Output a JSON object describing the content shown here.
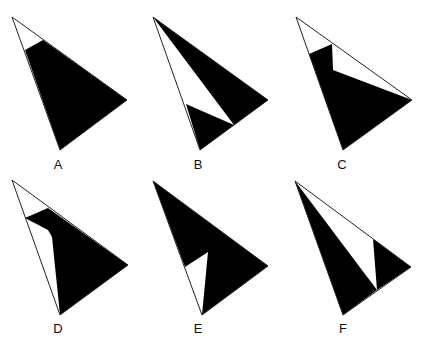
{
  "figure": {
    "colors": {
      "fill": "#000000",
      "outline": "#222222",
      "background": "#ffffff"
    },
    "panels": [
      {
        "label": "A",
        "label_pos": [
          58,
          158
        ],
        "outline": [
          [
            12,
            17
          ],
          [
            127,
            100
          ],
          [
            60,
            150
          ]
        ],
        "black": [
          [
            [
              25,
              50
            ],
            [
              43,
              40
            ],
            [
              127,
              100
            ],
            [
              60,
              150
            ]
          ]
        ]
      },
      {
        "label": "B",
        "label_pos": [
          198,
          158
        ],
        "outline": [
          [
            153,
            17
          ],
          [
            268,
            100
          ],
          [
            200,
            150
          ]
        ],
        "black": [
          [
            [
              153,
              17
            ],
            [
              268,
              100
            ],
            [
              234,
              125
            ]
          ],
          [
            [
              186,
              104
            ],
            [
              234,
              125
            ],
            [
              200,
              150
            ]
          ]
        ]
      },
      {
        "label": "C",
        "label_pos": [
          342,
          158
        ],
        "outline": [
          [
            296,
            17
          ],
          [
            412,
            100
          ],
          [
            343,
            150
          ]
        ],
        "black": [
          [
            [
              309,
              54
            ],
            [
              332,
              44
            ],
            [
              333,
              70
            ],
            [
              412,
              100
            ],
            [
              343,
              150
            ]
          ]
        ]
      },
      {
        "label": "D",
        "label_pos": [
          58,
          322
        ],
        "outline": [
          [
            12,
            180
          ],
          [
            128,
            265
          ],
          [
            60,
            315
          ]
        ],
        "black": [
          [
            [
              25,
              218
            ],
            [
              48,
              208
            ],
            [
              128,
              265
            ],
            [
              60,
              315
            ],
            [
              52,
              237
            ],
            [
              48,
              230
            ]
          ]
        ]
      },
      {
        "label": "E",
        "label_pos": [
          198,
          322
        ],
        "outline": [
          [
            153,
            181
          ],
          [
            268,
            266
          ],
          [
            202,
            315
          ]
        ],
        "black": [
          [
            [
              153,
              181
            ],
            [
              268,
              266
            ],
            [
              202,
              315
            ],
            [
              208,
              252
            ],
            [
              185,
              267
            ]
          ]
        ]
      },
      {
        "label": "F",
        "label_pos": [
          343,
          322
        ],
        "outline": [
          [
            295,
            181
          ],
          [
            411,
            267
          ],
          [
            343,
            315
          ]
        ],
        "black": [
          [
            [
              295,
              181
            ],
            [
              377,
              290
            ],
            [
              343,
              315
            ]
          ],
          [
            [
              373,
              239
            ],
            [
              411,
              267
            ],
            [
              377,
              290
            ]
          ]
        ]
      }
    ]
  }
}
